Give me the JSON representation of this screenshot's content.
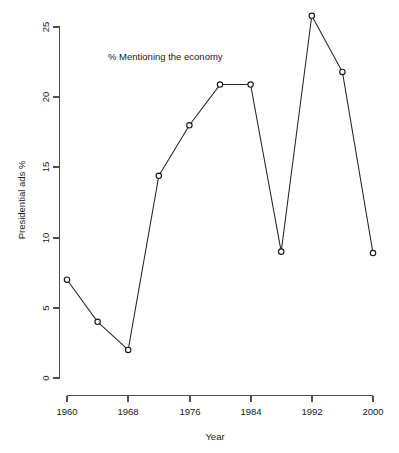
{
  "chart_data": {
    "type": "line",
    "title": "",
    "annotation": "% Mentioning the economy",
    "xlabel": "Year",
    "ylabel": "Presidential ads %",
    "grid": false,
    "legend": false,
    "marker": "open-circle",
    "x": [
      1960,
      1964,
      1968,
      1972,
      1976,
      1980,
      1984,
      1988,
      1992,
      1996,
      2000
    ],
    "values": [
      7,
      4,
      2,
      14.4,
      18,
      20.9,
      20.9,
      9,
      25.8,
      21.8,
      8.9
    ],
    "series": [
      {
        "name": "% Mentioning the economy",
        "points": [
          {
            "x": 1960,
            "y": 7
          },
          {
            "x": 1964,
            "y": 4
          },
          {
            "x": 1968,
            "y": 2
          },
          {
            "x": 1972,
            "y": 14.4
          },
          {
            "x": 1976,
            "y": 18
          },
          {
            "x": 1980,
            "y": 20.9
          },
          {
            "x": 1984,
            "y": 9
          },
          {
            "x": 1988,
            "y": 25.8
          },
          {
            "x": 1992,
            "y": 21.8
          },
          {
            "x": 1996,
            "y": 8.9
          }
        ]
      }
    ],
    "xlim": [
      1958,
      2002
    ],
    "ylim": [
      0,
      26.5
    ],
    "xticks": [
      1960,
      1968,
      1976,
      1984,
      1992,
      2000
    ],
    "xtick_labels": [
      "1960",
      "1968",
      "1976",
      "1984",
      "1992",
      "2000"
    ],
    "yticks": [
      0,
      5,
      10,
      15,
      20,
      25
    ],
    "ytick_labels": [
      "0",
      "5",
      "10",
      "15",
      "20",
      "25"
    ],
    "axis_color": "#4d4d4d",
    "line_color": "#262626",
    "marker_fill": "#ffffff",
    "background": "#ffffff"
  },
  "labels": {
    "annotation": "% Mentioning the economy",
    "xlabel": "Year",
    "ylabel": "Presidential ads %",
    "ytick_0": "0",
    "ytick_5": "5",
    "ytick_10": "10",
    "ytick_15": "15",
    "ytick_20": "20",
    "ytick_25": "25",
    "xtick_1960": "1960",
    "xtick_1968": "1968",
    "xtick_1976": "1976",
    "xtick_1984": "1984",
    "xtick_1992": "1992",
    "xtick_2000": "2000"
  }
}
